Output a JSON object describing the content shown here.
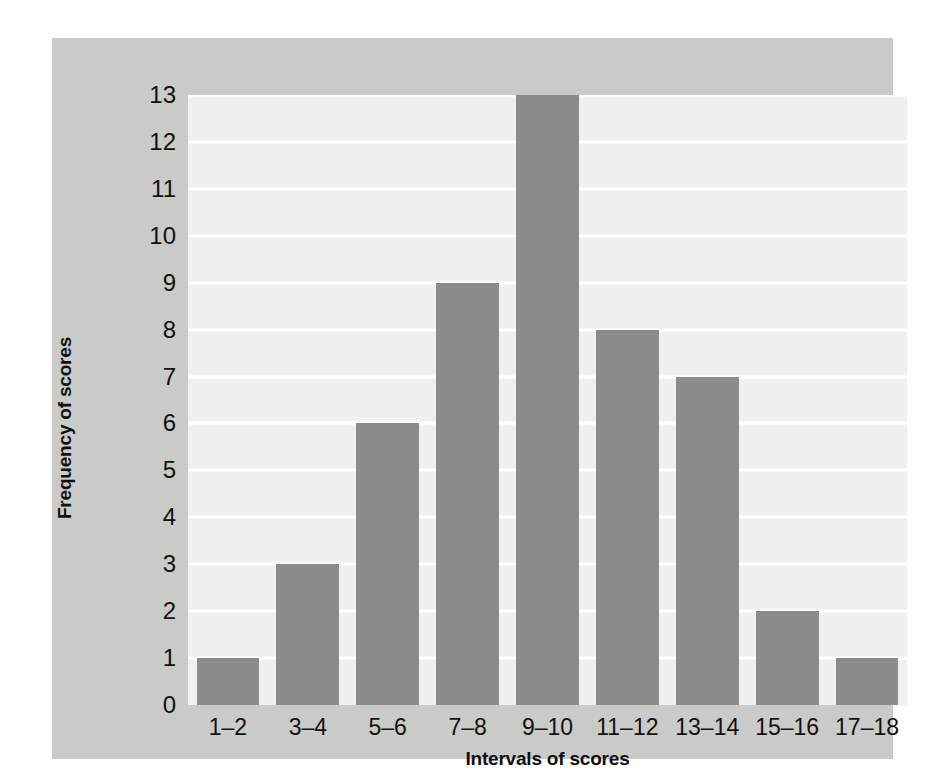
{
  "chart_data": {
    "type": "bar",
    "title": "",
    "subtitle": "",
    "xlabel": "Intervals of scores",
    "ylabel": "Frequency of scores",
    "categories": [
      "1–2",
      "3–4",
      "5–6",
      "7–8",
      "9–10",
      "11–12",
      "13–14",
      "15–16",
      "17–18"
    ],
    "values": [
      1,
      3,
      6,
      9,
      13,
      8,
      7,
      2,
      1
    ],
    "ylim": [
      0,
      13
    ],
    "ytick_labels": [
      "13",
      "12",
      "11",
      "10",
      "9",
      "8",
      "7",
      "6",
      "5",
      "4",
      "3",
      "2",
      "1",
      "0"
    ],
    "ytick_values": [
      13,
      12,
      11,
      10,
      9,
      8,
      7,
      6,
      5,
      4,
      3,
      2,
      1,
      0
    ],
    "grid": "horizontal",
    "legend": "none",
    "annotations": []
  },
  "style": {
    "bar_color": "#8b8b8a",
    "plot_background": "#f0f0ef",
    "panel_background": "#cacac8",
    "page_background": "#ffffff",
    "gridline_color": "#ffffff",
    "text_color": "#111111"
  }
}
